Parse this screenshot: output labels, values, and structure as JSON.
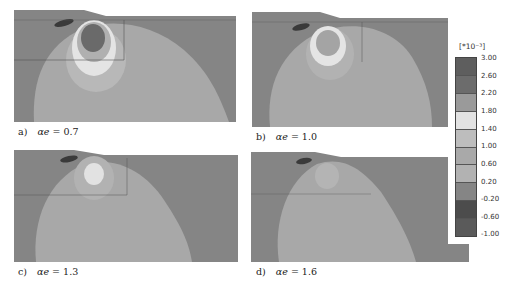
{
  "figure": {
    "panels": [
      {
        "id": "a",
        "label": "a)",
        "symbol": "αe",
        "equals": "= 0.7",
        "caption": "a)  αe = 0.7",
        "intensity": 0.7
      },
      {
        "id": "b",
        "label": "b)",
        "symbol": "αe",
        "equals": "= 1.0",
        "caption": "b)  αe = 1.0",
        "intensity": 1.0
      },
      {
        "id": "c",
        "label": "c)",
        "symbol": "αe",
        "equals": "= 1.3",
        "caption": "c)  αe = 1.3",
        "intensity": 1.3
      },
      {
        "id": "d",
        "label": "d)",
        "symbol": "αe",
        "equals": "= 1.6",
        "caption": "d)  αe = 1.6",
        "intensity": 1.6
      }
    ],
    "colorbar": {
      "unit": "[*10⁻³]",
      "ticks": [
        "3.00",
        "2.60",
        "2.20",
        "1.80",
        "1.40",
        "1.00",
        "0.60",
        "0.20",
        "-0.20",
        "-0.60",
        "-1.00"
      ],
      "segment_colors": [
        "#5e5e5e",
        "#6c6c6c",
        "#9a9a9a",
        "#e2e2e2",
        "#bdbdbd",
        "#a9a9a9",
        "#b2b2b2",
        "#858585",
        "#4c4c4c",
        "#5a5a5a"
      ]
    },
    "colors": {
      "background_field": "#858585",
      "bulb_field": "#a8a8a8",
      "ring_outer": "#b8b8b8",
      "ring_light": "#e4e4e4",
      "core_dark": "#6a6a6a",
      "surface_mark": "#3a3a3a"
    }
  }
}
